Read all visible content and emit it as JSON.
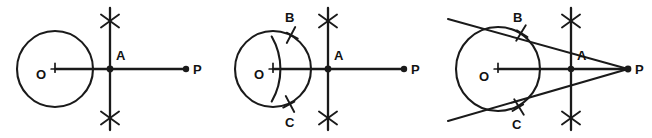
{
  "diagram": {
    "canvas": {
      "width": 652,
      "height": 138
    },
    "stroke_color": "#1a1a1a",
    "background_color": "#ffffff",
    "label_color": "#121212"
  },
  "figures": [
    {
      "id": "figure-1",
      "name": "step-1-perpendicular-bisector-of-OP",
      "offset_x": 0,
      "circle": {
        "cx": 55,
        "cy": 69,
        "r": 38
      },
      "center": {
        "x": 55,
        "y": 69,
        "label": "O",
        "label_x": 36,
        "label_y": 79,
        "tick_size": 7
      },
      "external_point": {
        "x": 186,
        "y": 69,
        "label": "P",
        "label_x": 193,
        "label_y": 74,
        "dot_r": 3.2
      },
      "segment_OP": {
        "x1": 55,
        "y1": 69,
        "x2": 186,
        "y2": 69
      },
      "midpoint": {
        "x": 110,
        "y": 69,
        "label": "A",
        "label_x": 116,
        "label_y": 60,
        "dot_r": 3.4
      },
      "bisector": {
        "x1": 110,
        "y1": 8,
        "x2": 110,
        "y2": 130
      },
      "arc_crosses": [
        {
          "x": 110,
          "y": 21,
          "size": 9
        },
        {
          "x": 110,
          "y": 118,
          "size": 9
        }
      ],
      "tangent_lines": [],
      "circle_points": []
    },
    {
      "id": "figure-2",
      "name": "step-2-semicircle-intersections-B-and-C",
      "offset_x": 218,
      "circle": {
        "cx": 273,
        "cy": 69,
        "r": 38
      },
      "center": {
        "x": 273,
        "y": 69,
        "label": "O",
        "label_x": 254,
        "label_y": 79,
        "tick_size": 7
      },
      "external_point": {
        "x": 404,
        "y": 69,
        "label": "P",
        "label_x": 411,
        "label_y": 74,
        "dot_r": 3.2
      },
      "segment_OP": {
        "x1": 273,
        "y1": 69,
        "x2": 404,
        "y2": 69
      },
      "midpoint": {
        "x": 328,
        "y": 69,
        "label": "A",
        "label_x": 334,
        "label_y": 60,
        "dot_r": 3.4
      },
      "bisector": {
        "x1": 328,
        "y1": 8,
        "x2": 328,
        "y2": 130
      },
      "arc_crosses": [
        {
          "x": 328,
          "y": 21,
          "size": 9
        },
        {
          "x": 328,
          "y": 118,
          "size": 9
        }
      ],
      "tangent_lines": [],
      "circle_points": [
        {
          "label": "B",
          "x": 291,
          "y": 35,
          "label_x": 285,
          "label_y": 22,
          "angle_deg": -62
        },
        {
          "label": "C",
          "x": 290,
          "y": 104,
          "label_x": 285,
          "label_y": 127,
          "angle_deg": 62
        }
      ],
      "construction_arc": {
        "cx": 328,
        "cy": 69,
        "r": 65,
        "start_deg": 150,
        "end_deg": 210
      }
    },
    {
      "id": "figure-3",
      "name": "step-3-tangent-lines-PB-and-PC",
      "offset_x": 434,
      "circle": {
        "cx": 498,
        "cy": 69,
        "r": 42
      },
      "center": {
        "x": 498,
        "y": 69,
        "label": "O",
        "label_x": 479,
        "label_y": 81,
        "tick_size": 7
      },
      "external_point": {
        "x": 628,
        "y": 69,
        "label": "P",
        "label_x": 635,
        "label_y": 74,
        "dot_r": 3.4
      },
      "segment_OP": {
        "x1": 498,
        "y1": 69,
        "x2": 628,
        "y2": 69
      },
      "midpoint": {
        "x": 571,
        "y": 69,
        "label": "A",
        "label_x": 577,
        "label_y": 60,
        "dot_r": 3.2
      },
      "bisector": {
        "x1": 571,
        "y1": 8,
        "x2": 571,
        "y2": 130
      },
      "arc_crosses": [
        {
          "x": 571,
          "y": 21,
          "size": 9
        },
        {
          "x": 571,
          "y": 118,
          "size": 9
        }
      ],
      "tangent_lines": [
        {
          "name": "tangent-PB",
          "x1": 448,
          "y1": 19,
          "x2": 628,
          "y2": 69
        },
        {
          "name": "tangent-PC",
          "x1": 448,
          "y1": 121,
          "x2": 628,
          "y2": 69
        }
      ],
      "circle_points": [
        {
          "label": "B",
          "x": 521,
          "y": 33,
          "label_x": 513,
          "label_y": 22,
          "angle_deg": -58
        },
        {
          "label": "C",
          "x": 519,
          "y": 107,
          "label_x": 512,
          "label_y": 129,
          "angle_deg": 58
        }
      ]
    }
  ],
  "labels": {
    "center": "O",
    "point_of_tangency_upper": "B",
    "point_of_tangency_lower": "C",
    "midpoint": "A",
    "external_point": "P"
  }
}
